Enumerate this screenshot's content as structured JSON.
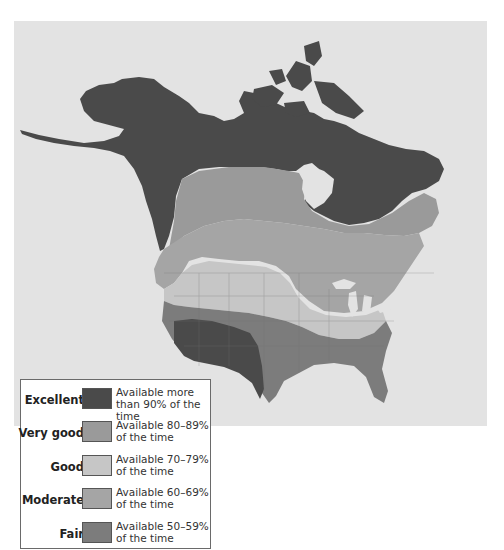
{
  "map": {
    "subject": "North America solar/resource availability by region",
    "ocean_color": "#e3e3e3",
    "zones": [
      {
        "id": "excellent",
        "regions": [
          "Alaska",
          "Northern Canada",
          "Arctic Archipelago",
          "Quebec-Labrador",
          "US Desert Southwest"
        ]
      },
      {
        "id": "very_good",
        "regions": [
          "Central Canada band",
          "Southern Canada"
        ]
      },
      {
        "id": "good",
        "regions": [
          "Northern Plains",
          "Great Basin",
          "Central US band"
        ]
      },
      {
        "id": "moderate",
        "regions": [
          "Pacific Northwest",
          "Great Lakes",
          "Northeast US",
          "Southeast US"
        ]
      },
      {
        "id": "fair",
        "regions": [
          "Southern Plains",
          "Gulf Coast",
          "Florida"
        ]
      }
    ]
  },
  "legend": {
    "items": [
      {
        "label": "Excellent",
        "description": "Available more than 90% of the time",
        "color": "#4a4a4a"
      },
      {
        "label": "Very good",
        "description": "Available 80–89% of the time",
        "color": "#9a9a9a"
      },
      {
        "label": "Good",
        "description": "Available 70–79% of the time",
        "color": "#c6c6c6"
      },
      {
        "label": "Moderate",
        "description": "Available 60–69% of the time",
        "color": "#a5a5a5"
      },
      {
        "label": "Fair",
        "description": "Available 50–59% of the time",
        "color": "#7c7c7c"
      }
    ]
  }
}
